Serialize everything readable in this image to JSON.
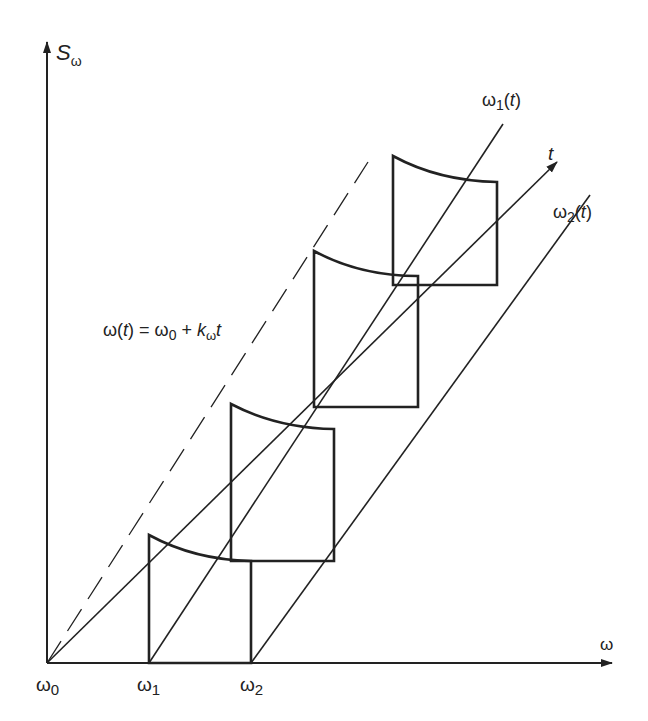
{
  "diagram": {
    "axes": {
      "y_label_main": "S",
      "y_label_sub": "ω",
      "x_label": "ω",
      "t_label": "t"
    },
    "x_ticks": [
      {
        "main": "ω",
        "sub": "0"
      },
      {
        "main": "ω",
        "sub": "1"
      },
      {
        "main": "ω",
        "sub": "2"
      }
    ],
    "line_labels": {
      "omega1_main": "ω",
      "omega1_sub": "1",
      "omega1_arg_open": "(",
      "omega1_arg": "t",
      "omega1_arg_close": ")",
      "omega2_main": "ω",
      "omega2_sub": "2",
      "omega2_arg_open": "(",
      "omega2_arg": "t",
      "omega2_arg_close": ")"
    },
    "equation": {
      "lhs": "ω(",
      "lhs_t": "t",
      "mid": ") = ω",
      "sub0": "0",
      "plus": " + ",
      "k": "k",
      "k_sub": "ω",
      "t": "t"
    },
    "colors": {
      "stroke": "#222222",
      "background": "#ffffff"
    },
    "panel_count": 4
  }
}
